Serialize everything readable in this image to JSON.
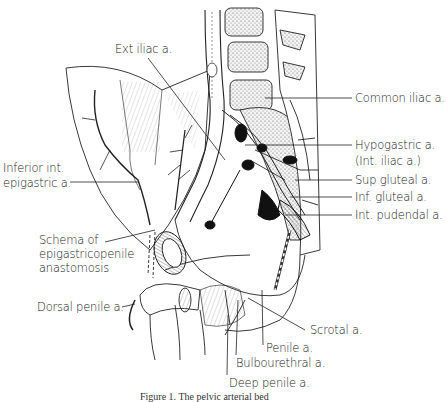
{
  "figure": {
    "caption": "Figure 1. The pelvic arterial bed",
    "labels": {
      "ext_iliac": "Ext iliac a.",
      "common_iliac": "Common iliac a.",
      "hypogastric_1": "Hypogastric a.",
      "hypogastric_2": "(Int. iliac a.)",
      "sup_gluteal": "Sup gluteal a.",
      "inf_gluteal": "Inf. gluteal a.",
      "int_pudendal": "Int. pudendal a.",
      "inferior_epigastric_1": "Inferior int.",
      "inferior_epigastric_2": "epigastric a.",
      "schema_1": "Schema of",
      "schema_2": "epigastricopenile",
      "schema_3": "anastomosis",
      "dorsal_penile": "Dorsal penile a.",
      "scrotal": "Scrotal a.",
      "penile": "Penile a.",
      "bulbourethral": "Bulbourethral a.",
      "deep_penile": "Deep penile a."
    }
  }
}
